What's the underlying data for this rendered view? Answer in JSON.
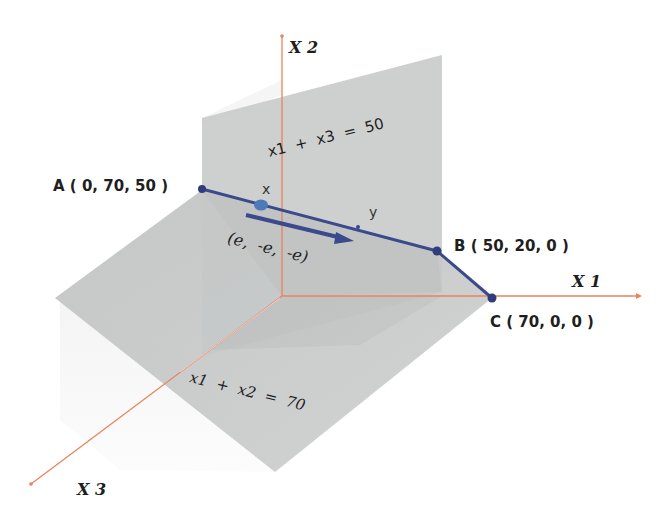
{
  "diagram": {
    "axes": {
      "x1": "X 1",
      "x2": "X 2",
      "x3": "X 3"
    },
    "planes": {
      "vertical_plane_equation": "x1  +  x3  =  50",
      "slanted_plane_equation": "x1  +  x2  =  70"
    },
    "points": {
      "A": "A ( 0, 70, 50 )",
      "B": "B ( 50, 20, 0 )",
      "C": "C ( 70, 0, 0 )",
      "x": "x",
      "y": "y"
    },
    "direction_vector": "(e,  -e,  -e)",
    "colors": {
      "axis": "#e8835a",
      "edge": "#3a4a8c",
      "plane": "#c4c6c6",
      "point_x": "#4f7ab8"
    }
  }
}
